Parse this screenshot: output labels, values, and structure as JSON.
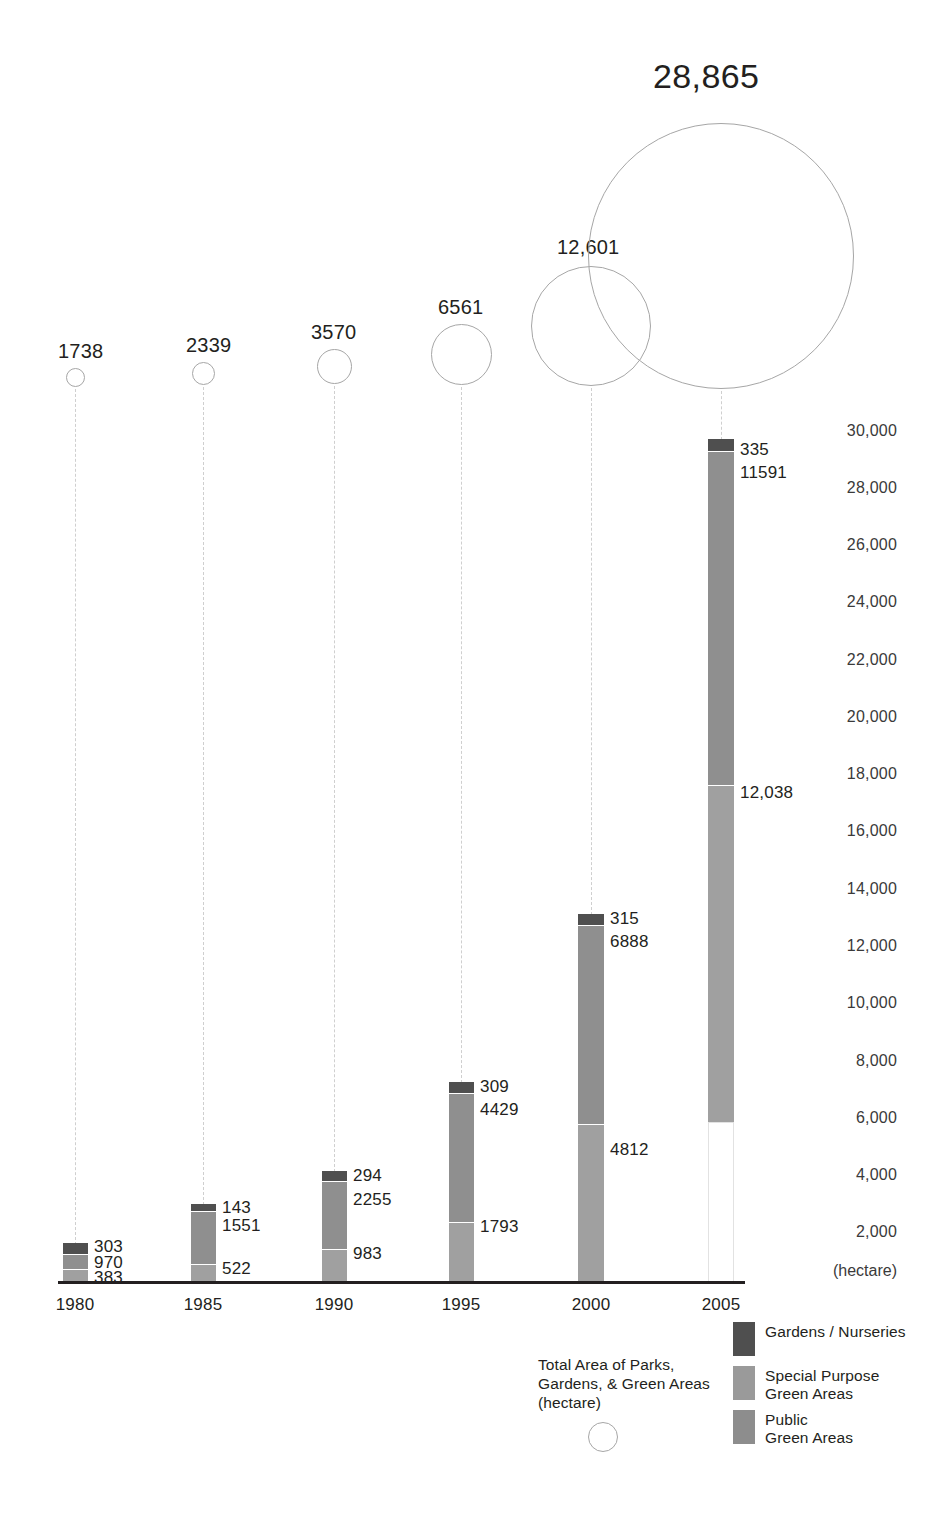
{
  "chart_data": {
    "type": "bar",
    "title": "",
    "subtitle": "",
    "xlabel": "",
    "ylabel": "(hectare)",
    "ylim": [
      0,
      30000
    ],
    "grid": false,
    "legend_position": "bottom-right",
    "categories": [
      "1980",
      "1985",
      "1990",
      "1995",
      "2000",
      "2005"
    ],
    "ytick_labels": [
      "30,000",
      "28,000",
      "26,000",
      "24,000",
      "22,000",
      "20,000",
      "18,000",
      "16,000",
      "14,000",
      "12,000",
      "10,000",
      "8,000",
      "6,000",
      "4,000",
      "2,000"
    ],
    "ytick_values": [
      30000,
      28000,
      26000,
      24000,
      22000,
      20000,
      18000,
      16000,
      14000,
      12000,
      10000,
      8000,
      6000,
      4000,
      2000
    ],
    "series": [
      {
        "name": "Public Green Areas",
        "color": "#8d8d8d",
        "values": [
          383,
          522,
          983,
          1793,
          4812,
          5941
        ],
        "labels": [
          "383",
          "522",
          "983",
          "1793",
          "4812",
          ""
        ]
      },
      {
        "name": "Special Purpose Green Areas",
        "color": "#9a9a9a",
        "values": [
          970,
          1551,
          2255,
          4429,
          6888,
          12038
        ],
        "labels": [
          "970",
          "1551",
          "2255",
          "4429",
          "6888",
          "12,038"
        ]
      },
      {
        "name": "Gardens / Nurseries",
        "color": "#4f4f4f",
        "values": [
          303,
          143,
          294,
          309,
          315,
          335
        ],
        "labels": [
          "303",
          "143",
          "294",
          "309",
          "315",
          "335"
        ]
      }
    ],
    "bubble_series": {
      "name": "Total Area of Parks, Gardens, & Green Areas (hectare)",
      "values": [
        1738,
        2339,
        3570,
        6561,
        12601,
        28865
      ],
      "labels": [
        "1738",
        "2339",
        "3570",
        "6561",
        "12,601",
        "28,865"
      ]
    },
    "extra_labels": {
      "2005_public_green_areas": "11591"
    }
  },
  "bubbles": [
    {
      "label": "1738",
      "cx": 75,
      "cy": 377,
      "r": 9.5,
      "label_x": 58,
      "label_y": 340,
      "big": false
    },
    {
      "label": "2339",
      "cx": 203,
      "cy": 373,
      "r": 11.5,
      "label_x": 186,
      "label_y": 334,
      "big": false
    },
    {
      "label": "3570",
      "cx": 334,
      "cy": 366,
      "r": 17.5,
      "label_x": 311,
      "label_y": 321,
      "big": false
    },
    {
      "label": "6561",
      "cx": 461,
      "cy": 354,
      "r": 30.5,
      "label_x": 438,
      "label_y": 296,
      "big": false
    },
    {
      "label": "12,601",
      "cx": 591,
      "cy": 326,
      "r": 60.0,
      "label_x": 557,
      "label_y": 236,
      "big": false
    },
    {
      "label": "28,865",
      "cx": 721,
      "cy": 256,
      "r": 133.0,
      "label_x": 653,
      "label_y": 57,
      "big": true
    }
  ],
  "leaders": [
    {
      "x": 75,
      "top": 389,
      "bottom": 1245
    },
    {
      "x": 203,
      "top": 387,
      "bottom": 1205
    },
    {
      "x": 334,
      "top": 386,
      "bottom": 1172
    },
    {
      "x": 461,
      "top": 387,
      "bottom": 1083
    },
    {
      "x": 591,
      "top": 388,
      "bottom": 915
    },
    {
      "x": 721,
      "top": 391,
      "bottom": 440
    }
  ],
  "bars": [
    {
      "year": "1980",
      "x": 63,
      "width": 25,
      "segments": [
        {
          "cls": "dark",
          "top": 1243,
          "height": 11,
          "label": "303",
          "label_x": 94,
          "label_y": 1237
        },
        {
          "cls": "mid",
          "top": 1254,
          "height": 25,
          "label": "970",
          "label_x": 94,
          "label_y": 1253
        },
        {
          "cls": "light",
          "top": 1269,
          "height": 13,
          "label": "383",
          "label_x": 94,
          "label_y": 1268
        }
      ]
    },
    {
      "year": "1985",
      "x": 191,
      "width": 25,
      "segments": [
        {
          "cls": "dark",
          "top": 1204,
          "height": 7,
          "label": "143",
          "label_x": 222,
          "label_y": 1198
        },
        {
          "cls": "mid",
          "top": 1211,
          "height": 53,
          "label": "1551",
          "label_x": 222,
          "label_y": 1216
        },
        {
          "cls": "light",
          "top": 1264,
          "height": 18,
          "label": "522",
          "label_x": 222,
          "label_y": 1259
        }
      ]
    },
    {
      "year": "1990",
      "x": 322,
      "width": 25,
      "segments": [
        {
          "cls": "dark",
          "top": 1171,
          "height": 10,
          "label": "294",
          "label_x": 353,
          "label_y": 1166
        },
        {
          "cls": "mid",
          "top": 1181,
          "height": 68,
          "label": "2255",
          "label_x": 353,
          "label_y": 1190
        },
        {
          "cls": "light",
          "top": 1249,
          "height": 33,
          "label": "983",
          "label_x": 353,
          "label_y": 1244
        }
      ]
    },
    {
      "year": "1995",
      "x": 449,
      "width": 25,
      "segments": [
        {
          "cls": "dark",
          "top": 1082,
          "height": 11,
          "label": "309",
          "label_x": 480,
          "label_y": 1077
        },
        {
          "cls": "mid",
          "top": 1093,
          "height": 129,
          "label": "4429",
          "label_x": 480,
          "label_y": 1100
        },
        {
          "cls": "light",
          "top": 1222,
          "height": 60,
          "label": "1793",
          "label_x": 480,
          "label_y": 1217
        }
      ]
    },
    {
      "year": "2000",
      "x": 578,
      "width": 26,
      "segments": [
        {
          "cls": "dark",
          "top": 914,
          "height": 11,
          "label": "315",
          "label_x": 610,
          "label_y": 909
        },
        {
          "cls": "mid",
          "top": 925,
          "height": 199,
          "label": "6888",
          "label_x": 610,
          "label_y": 932
        },
        {
          "cls": "light",
          "top": 1124,
          "height": 158,
          "label": "4812",
          "label_x": 610,
          "label_y": 1140
        }
      ]
    },
    {
      "year": "2005",
      "x": 708,
      "width": 26,
      "segments": [
        {
          "cls": "dark",
          "top": 439,
          "height": 12,
          "label": "335",
          "label_x": 740,
          "label_y": 440
        },
        {
          "cls": "mid",
          "top": 451,
          "height": 334,
          "label": "11591",
          "label_x": 740,
          "label_y": 463
        },
        {
          "cls": "light",
          "top": 785,
          "height": 337,
          "label": "12,038",
          "label_x": 740,
          "label_y": 783
        },
        {
          "cls": "hollow",
          "top": 1122,
          "height": 160,
          "label": "",
          "label_x": 740,
          "label_y": 1130
        }
      ]
    }
  ],
  "x_ticks": [
    {
      "label": "1980",
      "x": 75
    },
    {
      "label": "1985",
      "x": 203
    },
    {
      "label": "1990",
      "x": 334
    },
    {
      "label": "1995",
      "x": 461
    },
    {
      "label": "2000",
      "x": 591
    },
    {
      "label": "2005",
      "x": 721
    }
  ],
  "y_ticks": [
    {
      "label": "30,000",
      "y": 422
    },
    {
      "label": "28,000",
      "y": 479
    },
    {
      "label": "26,000",
      "y": 536
    },
    {
      "label": "24,000",
      "y": 593
    },
    {
      "label": "22,000",
      "y": 651
    },
    {
      "label": "20,000",
      "y": 708
    },
    {
      "label": "18,000",
      "y": 765
    },
    {
      "label": "16,000",
      "y": 822
    },
    {
      "label": "14,000",
      "y": 880
    },
    {
      "label": "12,000",
      "y": 937
    },
    {
      "label": "10,000",
      "y": 994
    },
    {
      "label": "8,000",
      "y": 1052
    },
    {
      "label": "6,000",
      "y": 1109
    },
    {
      "label": "4,000",
      "y": 1166
    },
    {
      "label": "2,000",
      "y": 1223
    }
  ],
  "y_unit": "(hectare)",
  "legend": {
    "items": [
      {
        "swatch": "dark",
        "label": "Gardens / Nurseries"
      },
      {
        "swatch": "mid",
        "label": "Special Purpose\nGreen Areas"
      },
      {
        "swatch": "light",
        "label": "Public\nGreen Areas"
      }
    ]
  },
  "bubble_legend": {
    "text": "Total Area of Parks,\nGardens, & Green Areas\n(hectare)"
  },
  "colors": {
    "dark_gray": "#4f4f4f",
    "mid_gray": "#9a9a9a",
    "light_gray": "#8d8d8d",
    "bubble_stroke": "#a6a6a6",
    "leader": "#cfcfcf",
    "axis": "#231f20",
    "text": "#231f20"
  }
}
